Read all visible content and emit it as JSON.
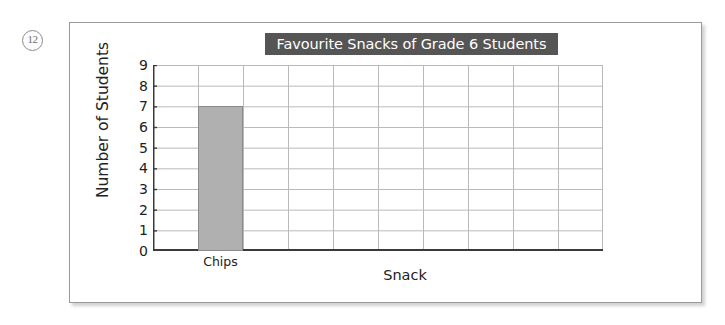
{
  "worksheet": {
    "question_number": "12"
  },
  "chart_data": {
    "type": "bar",
    "title": "Favourite Snacks of Grade 6 Students",
    "xlabel": "Snack",
    "ylabel": "Number of Students",
    "categories": [
      "Chips"
    ],
    "values": [
      7
    ],
    "ylim": [
      0,
      9
    ],
    "ytick_labels": [
      "0",
      "1",
      "2",
      "3",
      "4",
      "5",
      "6",
      "7",
      "8",
      "9"
    ],
    "ytick_values": [
      0,
      1,
      2,
      3,
      4,
      5,
      6,
      7,
      8,
      9
    ],
    "grid": true,
    "grid_columns": 10,
    "bar_column_index": 1,
    "legend": "none",
    "bar_color": "#b0b0b0",
    "bar_border_color": "#8a8a8a",
    "title_banner_color": "#555555",
    "title_text_color": "#ffffff",
    "axis_color": "#3a3a3a",
    "grid_color": "#b9b9b9"
  }
}
